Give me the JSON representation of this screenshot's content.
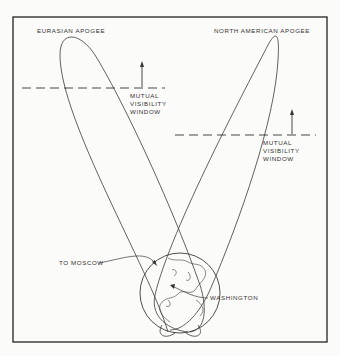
{
  "labels": {
    "eurasian_apogee": "EURASIAN APOGEE",
    "north_american_apogee": "NORTH AMERICAN APOGEE",
    "window_left": [
      "MUTUAL",
      "VISIBILITY",
      "WINDOW"
    ],
    "window_right": [
      "MUTUAL",
      "VISIBILITY",
      "WINDOW"
    ],
    "to_moscow": "TO MOSCOW",
    "washington": "WASHINGTON"
  },
  "colors": {
    "line": "#3a3a3a",
    "background": "#fbfbf9",
    "frame": "#222222"
  }
}
